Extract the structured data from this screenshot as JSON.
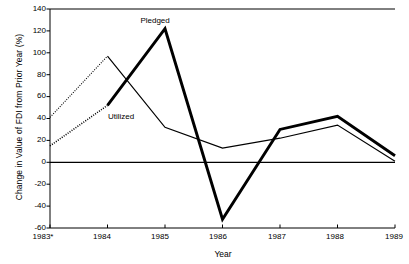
{
  "chart_data": {
    "type": "line",
    "title": "",
    "xlabel": "Year",
    "ylabel": "Change in Value of FDI from Prior Year (%)",
    "categories": [
      "1983*",
      "1984",
      "1985",
      "1986",
      "1987",
      "1988",
      "1989"
    ],
    "x": [
      1983,
      1984,
      1985,
      1986,
      1987,
      1988,
      1989
    ],
    "xlim": [
      1983,
      1989
    ],
    "ylim": [
      -60,
      140
    ],
    "yticks": [
      140,
      120,
      100,
      80,
      60,
      40,
      20,
      0,
      -20,
      -40,
      -60
    ],
    "ytick_labels": [
      "140",
      "120",
      "100",
      "80",
      "60",
      "40",
      "20",
      "0",
      "-20",
      "-40",
      "-60"
    ],
    "grid": false,
    "legend": "inline-annotations",
    "zero_line": 0,
    "series": [
      {
        "name": "Pledged",
        "style": "thick-solid",
        "first_segment_style": "dotted",
        "color": "#000000",
        "values": [
          15,
          52,
          122,
          -52,
          30,
          42,
          6
        ]
      },
      {
        "name": "Utilized",
        "style": "thin-solid",
        "first_segment_style": "dotted",
        "color": "#000000",
        "values": [
          41,
          97,
          32,
          13,
          22,
          34,
          1
        ]
      }
    ],
    "annotations": [
      {
        "text": "Pledged",
        "x": 1984.85,
        "y": 130
      },
      {
        "text": "Utilized",
        "x": 1984.25,
        "y": 42
      }
    ],
    "footnote_marker": "*"
  },
  "axes": {
    "y_title": "Change in Value of FDI from Prior Year (%)",
    "x_title": "Year"
  }
}
